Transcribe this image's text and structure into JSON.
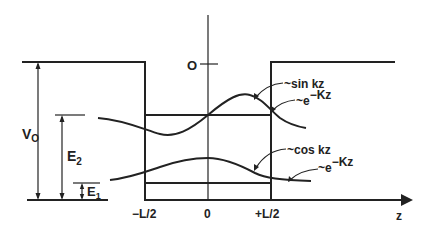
{
  "diagram": {
    "colors": {
      "ink": "#222222",
      "background": "#ffffff"
    },
    "labels": {
      "origin_energy": "O",
      "v0": "V",
      "v0_sub": "O",
      "e2": "E",
      "e2_sub": "2",
      "e1": "E",
      "e1_sub": "1",
      "x_left": "−L/2",
      "x_center": "0",
      "x_right": "+L/2",
      "x_axis": "z"
    },
    "annotations": {
      "sin": "~sin kz",
      "exp_upper": "~e",
      "exp_upper_sup": "−Kz",
      "cos": "~cos kz",
      "exp_lower": "~e",
      "exp_lower_sup": "−Kz"
    },
    "levels": [
      {
        "name": "E2",
        "description": "second bound state, odd wavefunction ~sin kz inside, ~e^-Kz outside"
      },
      {
        "name": "E1",
        "description": "ground state, even wavefunction ~cos kz inside, ~e^-Kz outside"
      }
    ]
  }
}
